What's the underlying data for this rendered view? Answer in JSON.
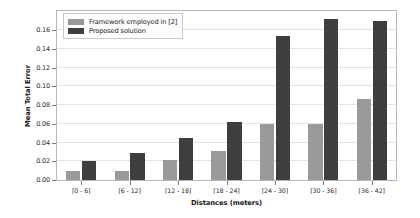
{
  "chart_data": {
    "type": "bar",
    "title": "",
    "xlabel": "Distances (meters)",
    "ylabel": "Mean Total Error",
    "categories": [
      "[0 - 6]",
      "[6 - 12]",
      "[12 - 18]",
      "[18 - 24]",
      "[24 - 30]",
      "[30 - 36]",
      "[36 - 42]"
    ],
    "series": [
      {
        "name": "Framework employed in [2]",
        "color": "#9a9a9a",
        "values": [
          0.01,
          0.01,
          0.021,
          0.031,
          0.06,
          0.06,
          0.086
        ]
      },
      {
        "name": "Proposed solution",
        "color": "#3e3e3e",
        "values": [
          0.02,
          0.029,
          0.045,
          0.062,
          0.154,
          0.172,
          0.17
        ]
      }
    ],
    "ylim": [
      0.0,
      0.1805
    ],
    "yticks": [
      0.0,
      0.02,
      0.04,
      0.06,
      0.08,
      0.1,
      0.12,
      0.14,
      0.16
    ],
    "ytick_labels": [
      "0.00",
      "0.02",
      "0.04",
      "0.06",
      "0.08",
      "0.10",
      "0.12",
      "0.14",
      "0.16"
    ],
    "grid": true,
    "legend_position": "upper left"
  },
  "legend": {
    "entries": [
      {
        "label": "Framework employed in [2]",
        "swatch": "light"
      },
      {
        "label": "Proposed solution",
        "swatch": "dark"
      }
    ]
  }
}
